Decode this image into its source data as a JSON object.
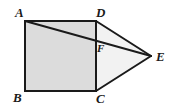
{
  "figure": {
    "name": "prism-net-diagram",
    "background_color": "#ffffff",
    "stroke_color": "#1a1a1a",
    "stroke_width": 2,
    "faces": {
      "rectangle_ABCD": {
        "name": "square-face-ABCD",
        "fill_color": "#dcdcdc",
        "points": "25,21 96,21 96,91 25,91"
      },
      "triangle_DCE": {
        "name": "triangle-face-DCE",
        "fill_color": "#f2f2f2",
        "points": "96,21 151,56 96,91"
      }
    },
    "edges": [
      {
        "name": "edge-AD",
        "from": "A",
        "to": "D",
        "x1": 25,
        "y1": 21,
        "x2": 96,
        "y2": 21
      },
      {
        "name": "edge-AB",
        "from": "A",
        "to": "B",
        "x1": 25,
        "y1": 21,
        "x2": 25,
        "y2": 91
      },
      {
        "name": "edge-BC",
        "from": "B",
        "to": "C",
        "x1": 25,
        "y1": 91,
        "x2": 96,
        "y2": 91
      },
      {
        "name": "edge-DC",
        "from": "D",
        "to": "C",
        "x1": 96,
        "y1": 21,
        "x2": 96,
        "y2": 91
      },
      {
        "name": "edge-DE",
        "from": "D",
        "to": "E",
        "x1": 96,
        "y1": 21,
        "x2": 151,
        "y2": 56
      },
      {
        "name": "edge-CE",
        "from": "C",
        "to": "E",
        "x1": 96,
        "y1": 91,
        "x2": 151,
        "y2": 56
      },
      {
        "name": "edge-AE-diagonal",
        "from": "A",
        "to": "E",
        "x1": 25,
        "y1": 21,
        "x2": 151,
        "y2": 56
      }
    ],
    "vertices": [
      {
        "name": "vertex-label-A",
        "label": "A",
        "x": 25,
        "y": 21,
        "size": "outer"
      },
      {
        "name": "vertex-label-D",
        "label": "D",
        "x": 96,
        "y": 21,
        "size": "outer"
      },
      {
        "name": "vertex-label-B",
        "label": "B",
        "x": 25,
        "y": 91,
        "size": "outer"
      },
      {
        "name": "vertex-label-C",
        "label": "C",
        "x": 96,
        "y": 91,
        "size": "outer"
      },
      {
        "name": "vertex-label-E",
        "label": "E",
        "x": 151,
        "y": 56,
        "size": "outer"
      },
      {
        "name": "vertex-label-F",
        "label": "F",
        "x": 96,
        "y": 42,
        "size": "inner"
      }
    ],
    "labels": {
      "A": "A",
      "B": "B",
      "C": "C",
      "D": "D",
      "E": "E",
      "F": "F"
    }
  }
}
